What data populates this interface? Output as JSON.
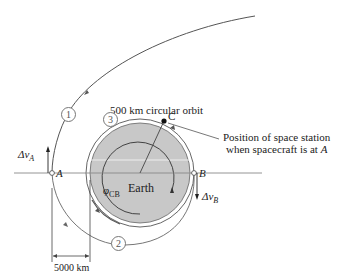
{
  "labels": {
    "orbit_title": "500 km circular orbit",
    "point_c": "C",
    "station_note_line1": "Position of space station",
    "station_note_line2": "when spacecraft is at",
    "station_note_point": "A",
    "point_a": "A",
    "point_b": "B",
    "delta_va": "Δv",
    "delta_va_sub": "A",
    "delta_vb": "Δv",
    "delta_vb_sub": "B",
    "earth": "Earth",
    "phi": "φ",
    "phi_sub": "CB",
    "distance": "5000 km"
  },
  "orbit_markers": [
    "1",
    "2",
    "3"
  ],
  "colors": {
    "earth_fill": "#c8c8c8",
    "line": "#555555",
    "axis": "#888888"
  }
}
